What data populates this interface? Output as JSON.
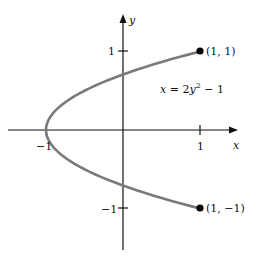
{
  "figure": {
    "equation": "x = 2y² − 1",
    "eq_parts": {
      "lhs": "x = 2",
      "var": "y",
      "exp": "2",
      "rhs": " − 1"
    },
    "axes": {
      "x_label": "x",
      "y_label": "y",
      "x_ticks": [
        {
          "value": -1,
          "label": "−1"
        },
        {
          "value": 1,
          "label": "1"
        }
      ],
      "y_ticks": [
        {
          "value": 1,
          "label": "1"
        },
        {
          "value": -1,
          "label": "−1"
        }
      ]
    },
    "points": [
      {
        "label": "(1, 1)",
        "x": 1,
        "y": 1
      },
      {
        "label": "(1, −1)",
        "x": 1,
        "y": -1
      }
    ],
    "curve": {
      "type": "parabola",
      "equation": "x = 2y^2 - 1",
      "y_range": [
        -1,
        1
      ],
      "color": "#7a7a7a"
    }
  }
}
